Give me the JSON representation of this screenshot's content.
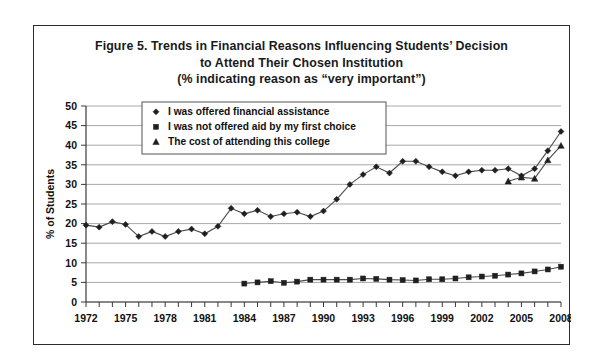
{
  "figure": {
    "title_lines": [
      "Figure 5. Trends in Financial Reasons Influencing Students’ Decision",
      "to Attend Their Chosen Institution",
      "(% indicating reason as “very important”)"
    ]
  },
  "colors": {
    "frame": "#2b2b2b",
    "gridline": "#a9a9a9",
    "axis": "#3a3a3a",
    "series_line": "#4a4a4a",
    "marker": "#1f1f1f",
    "background": "#ffffff"
  },
  "chart_data": {
    "type": "line",
    "title": "Figure 5. Trends in Financial Reasons Influencing Students’ Decision to Attend Their Chosen Institution (% indicating reason as “very important”)",
    "xlabel": "",
    "ylabel": "% of Students",
    "xlim": [
      1972,
      2008
    ],
    "ylim": [
      0,
      50
    ],
    "ytick_step": 5,
    "yticks": [
      0,
      5,
      10,
      15,
      20,
      25,
      30,
      35,
      40,
      45,
      50
    ],
    "ytick_labels": [
      "0",
      "5",
      "10",
      "15",
      "20",
      "25",
      "30",
      "35",
      "40",
      "45",
      "50"
    ],
    "x_tick_years_all": [
      1972,
      1973,
      1974,
      1975,
      1976,
      1977,
      1978,
      1979,
      1980,
      1981,
      1982,
      1983,
      1984,
      1985,
      1986,
      1987,
      1988,
      1989,
      1990,
      1991,
      1992,
      1993,
      1994,
      1995,
      1996,
      1997,
      1998,
      1999,
      2000,
      2001,
      2002,
      2003,
      2004,
      2005,
      2006,
      2007,
      2008
    ],
    "xtick_labels": [
      "1972",
      "1975",
      "1978",
      "1981",
      "1984",
      "1987",
      "1990",
      "1993",
      "1996",
      "1999",
      "2002",
      "2005",
      "2008"
    ],
    "xtick_label_years": [
      1972,
      1975,
      1978,
      1981,
      1984,
      1987,
      1990,
      1993,
      1996,
      1999,
      2002,
      2005,
      2008
    ],
    "grid": "horizontal",
    "legend_position": "upper-left-inside",
    "series": [
      {
        "name": "I was offered financial assistance",
        "marker": "diamond",
        "x": [
          1972,
          1973,
          1974,
          1975,
          1976,
          1977,
          1978,
          1979,
          1980,
          1981,
          1982,
          1983,
          1984,
          1985,
          1986,
          1987,
          1988,
          1989,
          1990,
          1991,
          1992,
          1993,
          1994,
          1995,
          1996,
          1997,
          1998,
          1999,
          2000,
          2001,
          2002,
          2003,
          2004,
          2005,
          2006,
          2007,
          2008
        ],
        "values": [
          19.6,
          19.1,
          20.5,
          19.8,
          16.7,
          18.0,
          16.7,
          18.0,
          18.6,
          17.4,
          19.3,
          23.9,
          22.5,
          23.4,
          21.8,
          22.5,
          22.9,
          21.8,
          23.2,
          26.2,
          30.0,
          32.5,
          34.5,
          32.9,
          35.9,
          35.9,
          34.5,
          33.2,
          32.2,
          33.2,
          33.6,
          33.6,
          34.0,
          32.2,
          34.0,
          38.6,
          43.5
        ]
      },
      {
        "name": "I was not offered aid by my first choice",
        "marker": "square",
        "x": [
          1984,
          1985,
          1986,
          1987,
          1988,
          1989,
          1990,
          1991,
          1992,
          1993,
          1994,
          1995,
          1996,
          1997,
          1998,
          1999,
          2000,
          2001,
          2002,
          2003,
          2004,
          2005,
          2006,
          2007,
          2008
        ],
        "values": [
          4.7,
          5.0,
          5.3,
          4.9,
          5.2,
          5.7,
          5.7,
          5.7,
          5.7,
          6.0,
          5.9,
          5.7,
          5.6,
          5.5,
          5.8,
          5.8,
          6.0,
          6.3,
          6.5,
          6.7,
          7.0,
          7.3,
          7.8,
          8.3,
          9.0
        ]
      },
      {
        "name": "The cost of attending this college",
        "marker": "triangle",
        "x": [
          2004,
          2005,
          2006,
          2007,
          2008
        ],
        "values": [
          30.8,
          31.8,
          31.5,
          36.2,
          39.9
        ]
      }
    ]
  },
  "legend": {
    "entries": [
      {
        "label": "I was offered financial assistance",
        "marker": "diamond"
      },
      {
        "label": "I was not offered aid by my first choice",
        "marker": "square"
      },
      {
        "label": "The cost of attending this college",
        "marker": "triangle"
      }
    ]
  }
}
